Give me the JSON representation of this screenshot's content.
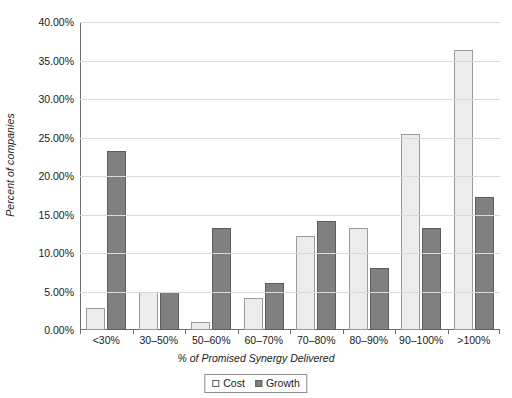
{
  "chart_data": {
    "type": "bar",
    "title": "",
    "xlabel": "% of Promised Synergy Delivered",
    "ylabel": "Percent of companies",
    "categories": [
      "<30%",
      "30–50%",
      "50–60%",
      "60–70%",
      "70–80%",
      "80–90%",
      "90–100%",
      ">100%"
    ],
    "series": [
      {
        "name": "Cost",
        "color": "#ececec",
        "values": [
          2.9,
          5.0,
          1.0,
          4.1,
          12.2,
          13.2,
          25.4,
          36.4
        ]
      },
      {
        "name": "Growth",
        "color": "#808080",
        "values": [
          23.2,
          5.0,
          13.2,
          6.1,
          14.2,
          8.1,
          13.2,
          17.3
        ]
      }
    ],
    "ylim": [
      0,
      40
    ],
    "ytick_values": [
      0,
      5,
      10,
      15,
      20,
      25,
      30,
      35,
      40
    ],
    "ytick_labels": [
      "0.00%",
      "5.00%",
      "10.00%",
      "15.00%",
      "20.00%",
      "25.00%",
      "30.00%",
      "35.00%",
      "40.00%"
    ],
    "grid": true,
    "legend_position": "bottom",
    "legend_entries": [
      "Cost",
      "Growth"
    ]
  },
  "axes": {
    "y_title": "Percent of companies",
    "x_title": "% of Promised Synergy Delivered"
  },
  "legend": {
    "items": [
      {
        "label": "Cost"
      },
      {
        "label": "Growth"
      }
    ]
  }
}
